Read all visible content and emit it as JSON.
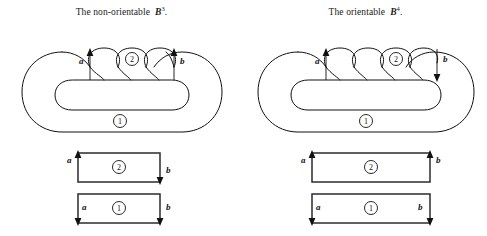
{
  "figure": {
    "title_left": "The non-orientable",
    "title_right": "The orientable",
    "panels": [
      {
        "id": "non-orientable",
        "caption_text": "The non-orientable",
        "caption_symbol": "B",
        "caption_superscript": "3",
        "caption_period": ".",
        "lobe_count": 4,
        "marked_lobe_index": 2,
        "region_labels": {
          "outer": "1",
          "lobe": "2"
        },
        "edge_labels": {
          "left": "a",
          "right": "b"
        },
        "blob_arrows": {
          "a": "up",
          "b": "up"
        },
        "strips": [
          {
            "region": "2",
            "left_label": "a",
            "right_label": "b",
            "left_arrow": "up",
            "right_arrow": "down"
          },
          {
            "region": "1",
            "left_label": "a",
            "right_label": "b",
            "left_arrow": "down",
            "right_arrow": "down"
          }
        ]
      },
      {
        "id": "orientable",
        "caption_text": "The orientable",
        "caption_symbol": "B",
        "caption_superscript": "4",
        "caption_period": ".",
        "lobe_count": 5,
        "marked_lobe_index": 3,
        "region_labels": {
          "outer": "1",
          "lobe": "2"
        },
        "edge_labels": {
          "left": "a",
          "right": "b"
        },
        "blob_arrows": {
          "a": "up",
          "b": "down"
        },
        "strips": [
          {
            "region": "2",
            "left_label": "a",
            "right_label": "b",
            "left_arrow": "up",
            "right_arrow": "up"
          },
          {
            "region": "1",
            "left_label": "a",
            "right_label": "b",
            "left_arrow": "down",
            "right_arrow": "down"
          }
        ]
      }
    ]
  }
}
